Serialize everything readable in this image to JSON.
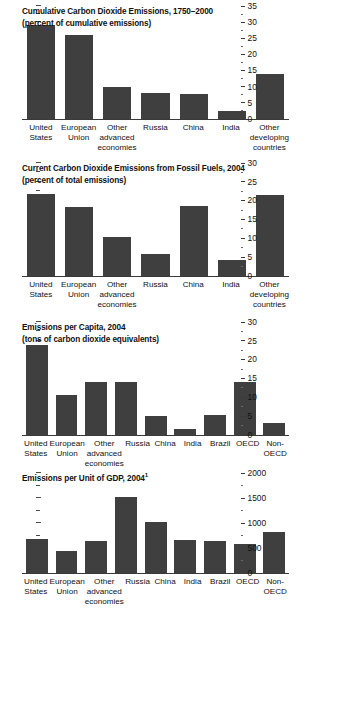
{
  "figure": {
    "background": "#ffffff",
    "bar_color": "#3f3f3f",
    "axis_color": "#3a3a3a"
  },
  "chart_data": [
    {
      "type": "bar",
      "id": "cumulative-emissions",
      "title": "Cumulative Carbon Dioxide Emissions, 1750–2000",
      "subtitle": "(percent of cumulative emissions)",
      "xlabel": "",
      "ylabel": "",
      "ylim": [
        0,
        35
      ],
      "ytick_step": 5,
      "yticks": [
        0,
        5,
        10,
        15,
        20,
        25,
        30,
        35
      ],
      "ytick_labels": [
        "0",
        "5",
        "10",
        "15",
        "20",
        "25",
        "30",
        "35"
      ],
      "minor_ticks": true,
      "legend": "none",
      "grid": false,
      "axis_position": "right",
      "categories": [
        [
          "United",
          "States"
        ],
        [
          "European",
          "Union"
        ],
        [
          "Other",
          "advanced",
          "economies"
        ],
        [
          "Russia"
        ],
        [
          "China"
        ],
        [
          "India"
        ],
        [
          "Other",
          "developing",
          "countries"
        ]
      ],
      "category_labels": [
        "United States",
        "European Union",
        "Other advanced economies",
        "Russia",
        "China",
        "India",
        "Other developing countries"
      ],
      "values": [
        29,
        26,
        10,
        8,
        7.8,
        2.5,
        14
      ]
    },
    {
      "type": "bar",
      "id": "current-fossil-fuel-emissions",
      "title": "Current Carbon Dioxide Emissions from Fossil Fuels, 2004",
      "subtitle": "(percent of total emissions)",
      "xlabel": "",
      "ylabel": "",
      "ylim": [
        0,
        30
      ],
      "ytick_step": 5,
      "yticks": [
        0,
        5,
        10,
        15,
        20,
        25,
        30
      ],
      "ytick_labels": [
        "0",
        "5",
        "10",
        "15",
        "20",
        "25",
        "30"
      ],
      "minor_ticks": true,
      "legend": "none",
      "grid": false,
      "axis_position": "right",
      "categories": [
        [
          "United",
          "States"
        ],
        [
          "European",
          "Union"
        ],
        [
          "Other",
          "advanced",
          "economies"
        ],
        [
          "Russia"
        ],
        [
          "China"
        ],
        [
          "India"
        ],
        [
          "Other",
          "developing",
          "countries"
        ]
      ],
      "category_labels": [
        "United States",
        "European Union",
        "Other advanced economies",
        "Russia",
        "China",
        "India",
        "Other developing countries"
      ],
      "values": [
        21.8,
        18.3,
        10.3,
        5.8,
        18.5,
        4.3,
        21.5
      ]
    },
    {
      "type": "bar",
      "id": "emissions-per-capita",
      "title": "Emissions per Capita, 2004",
      "subtitle": "(tons of carbon dioxide equivalents)",
      "xlabel": "",
      "ylabel": "",
      "ylim": [
        0,
        30
      ],
      "ytick_step": 5,
      "yticks": [
        0,
        5,
        10,
        15,
        20,
        25,
        30
      ],
      "ytick_labels": [
        "0",
        "5",
        "10",
        "15",
        "20",
        "25",
        "30"
      ],
      "minor_ticks": true,
      "legend": "none",
      "grid": false,
      "axis_position": "right",
      "categories": [
        [
          "United",
          "States"
        ],
        [
          "European",
          "Union"
        ],
        [
          "Other",
          "advanced",
          "economies"
        ],
        [
          "Russia"
        ],
        [
          "China"
        ],
        [
          "India"
        ],
        [
          "Brazil"
        ],
        [
          "OECD"
        ],
        [
          "Non-",
          "OECD"
        ]
      ],
      "category_labels": [
        "United States",
        "European Union",
        "Other advanced economies",
        "Russia",
        "China",
        "India",
        "Brazil",
        "OECD",
        "Non-OECD"
      ],
      "values": [
        24,
        10.5,
        14,
        14,
        5,
        1.7,
        5.4,
        14,
        3.3
      ]
    },
    {
      "type": "bar",
      "id": "emissions-per-unit-gdp",
      "title": "Emissions per Unit of GDP, 2004",
      "title_superscript": "1",
      "subtitle": "",
      "xlabel": "",
      "ylabel": "",
      "ylim": [
        0,
        2000
      ],
      "ytick_step": 500,
      "yticks": [
        0,
        500,
        1000,
        1500,
        2000
      ],
      "ytick_labels": [
        "0",
        "500",
        "1000",
        "1500",
        "2000"
      ],
      "minor_ticks": true,
      "legend": "none",
      "grid": false,
      "axis_position": "right",
      "categories": [
        [
          "United",
          "States"
        ],
        [
          "European",
          "Union"
        ],
        [
          "Other",
          "advanced",
          "economies"
        ],
        [
          "Russia"
        ],
        [
          "China"
        ],
        [
          "India"
        ],
        [
          "Brazil"
        ],
        [
          "OECD"
        ],
        [
          "Non-",
          "OECD"
        ]
      ],
      "category_labels": [
        "United States",
        "European Union",
        "Other advanced economies",
        "Russia",
        "China",
        "India",
        "Brazil",
        "OECD",
        "Non-OECD"
      ],
      "values": [
        680,
        440,
        650,
        1520,
        1020,
        670,
        640,
        590,
        830
      ]
    }
  ]
}
